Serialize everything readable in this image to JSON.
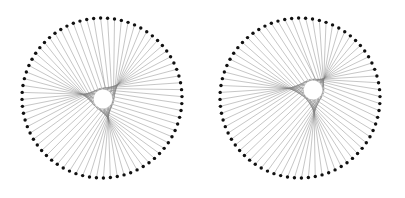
{
  "figure": {
    "title": "",
    "background_color": "#ffffff",
    "width": 405,
    "height": 198,
    "panel_count": 2
  },
  "chart_data": {
    "type": "scatter",
    "title": "",
    "subtitle": "",
    "xlabel": "",
    "ylabel": "",
    "grid": false,
    "legend": null,
    "axes_visible": false,
    "tick_labels": [],
    "annotations": [],
    "panels": [
      {
        "name": "left-figure",
        "index": 0,
        "outer_center": [
          102,
          98
        ],
        "outer_radius": 80,
        "inner_center": [
          103,
          99
        ],
        "inner_radius": 11,
        "n_points": 72,
        "angle_multiplier": 4.06,
        "start_angle_deg": -96,
        "inner_phase_deg": 18,
        "line_color": "#808080",
        "line_width": 0.45,
        "dot_color": "#111111",
        "dot_radius": 1.7,
        "envelope_radius": 46
      },
      {
        "name": "right-figure",
        "index": 1,
        "outer_center": [
          300,
          98
        ],
        "outer_radius": 80,
        "inner_center": [
          313,
          90
        ],
        "inner_radius": 11,
        "n_points": 72,
        "angle_multiplier": 4.06,
        "start_angle_deg": -96,
        "inner_phase_deg": 18,
        "line_color": "#808080",
        "line_width": 0.45,
        "dot_color": "#111111",
        "dot_radius": 1.7,
        "envelope_radius": 46
      }
    ],
    "x": [],
    "values": [],
    "categories": [],
    "xlim": [
      0,
      405
    ],
    "ylim": [
      0,
      198
    ]
  }
}
